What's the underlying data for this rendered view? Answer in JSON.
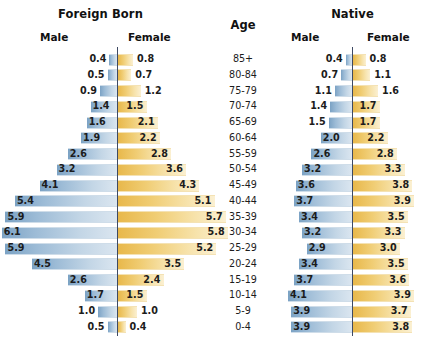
{
  "chart_data": {
    "type": "bar",
    "chart_kind": "population-pyramid",
    "panels": [
      {
        "key": "foreign",
        "title": "Foreign Born",
        "male_label": "Male",
        "female_label": "Female"
      },
      {
        "key": "native",
        "title": "Native",
        "male_label": "Male",
        "female_label": "Female"
      }
    ],
    "center_header": "Age",
    "xlabel": "",
    "ylabel": "Age",
    "grid": false,
    "legend": "none",
    "units": "percent",
    "categories": [
      "85+",
      "80-84",
      "75-79",
      "70-74",
      "65-69",
      "60-64",
      "55-59",
      "50-54",
      "45-49",
      "40-44",
      "35-39",
      "30-34",
      "25-29",
      "20-24",
      "15-19",
      "10-14",
      "5-9",
      "0-4"
    ],
    "series": [
      {
        "name": "Foreign Born Male",
        "panel": "foreign",
        "side": "left",
        "values": [
          0.4,
          0.5,
          0.9,
          1.4,
          1.6,
          1.9,
          2.6,
          3.2,
          4.1,
          5.4,
          5.9,
          6.1,
          5.9,
          4.5,
          2.6,
          1.7,
          1.0,
          0.5
        ]
      },
      {
        "name": "Foreign Born Female",
        "panel": "foreign",
        "side": "right",
        "values": [
          0.8,
          0.7,
          1.2,
          1.5,
          2.1,
          2.2,
          2.8,
          3.6,
          4.3,
          5.1,
          5.7,
          5.8,
          5.2,
          3.5,
          2.4,
          1.5,
          1.0,
          0.4
        ]
      },
      {
        "name": "Native Male",
        "panel": "native",
        "side": "left",
        "values": [
          0.4,
          0.7,
          1.1,
          1.4,
          1.5,
          2.0,
          2.6,
          3.2,
          3.6,
          3.7,
          3.4,
          3.2,
          2.9,
          3.4,
          3.7,
          4.1,
          3.9,
          3.9
        ]
      },
      {
        "name": "Native Female",
        "panel": "native",
        "side": "right",
        "values": [
          0.8,
          1.1,
          1.6,
          1.7,
          1.7,
          2.2,
          2.8,
          3.3,
          3.8,
          3.9,
          3.5,
          3.3,
          3.0,
          3.5,
          3.6,
          3.9,
          3.7,
          3.8
        ]
      }
    ],
    "value_labels": {
      "foreign_male": [
        "0.4",
        "0.5",
        "0.9",
        "1.4",
        "1.6",
        "1.9",
        "2.6",
        "3.2",
        "4.1",
        "5.4",
        "5.9",
        "6.1",
        "5.9",
        "4.5",
        "2.6",
        "1.7",
        "1.0",
        "0.5"
      ],
      "foreign_female": [
        "0.8",
        "0.7",
        "1.2",
        "1.5",
        "2.1",
        "2.2",
        "2.8",
        "3.6",
        "4.3",
        "5.1",
        "5.7",
        "5.8",
        "5.2",
        "3.5",
        "2.4",
        "1.5",
        "1.0",
        "0.4"
      ],
      "native_male": [
        "0.4",
        "0.7",
        "1.1",
        "1.4",
        "1.5",
        "2.0",
        "2.6",
        "3.2",
        "3.6",
        "3.7",
        "3.4",
        "3.2",
        "2.9",
        "3.4",
        "3.7",
        "4.1",
        "3.9",
        "3.9"
      ],
      "native_female": [
        "0.8",
        "1.1",
        "1.6",
        "1.7",
        "1.7",
        "2.2",
        "2.8",
        "3.3",
        "3.8",
        "3.9",
        "3.5",
        "3.3",
        "3.0",
        "3.5",
        "3.6",
        "3.9",
        "3.7",
        "3.8"
      ]
    },
    "colors": {
      "male_bar": "#9cbbd6",
      "female_bar": "#f0cd74",
      "axis": "#3e4a63",
      "text": "#1c1c1c",
      "background": "#ffffff"
    },
    "scale": {
      "foreign_px_per_unit": 18.9,
      "native_px_per_unit": 15.6,
      "max_value": 6.1
    }
  }
}
